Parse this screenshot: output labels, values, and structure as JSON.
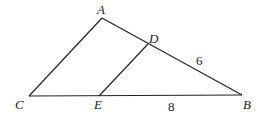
{
  "diagram": {
    "title": "",
    "type": "triangle-with-parallel-segment",
    "stroke_color": "#222222",
    "background": "#ffffff",
    "vertices": {
      "A": {
        "label": "A",
        "x": 102,
        "y": 18
      },
      "B": {
        "label": "B",
        "x": 242,
        "y": 95
      },
      "C": {
        "label": "C",
        "x": 29,
        "y": 96
      },
      "D": {
        "label": "D",
        "x": 148,
        "y": 44
      },
      "E": {
        "label": "E",
        "x": 99,
        "y": 96
      }
    },
    "segments": [
      {
        "from": "A",
        "to": "C"
      },
      {
        "from": "A",
        "to": "B"
      },
      {
        "from": "C",
        "to": "B"
      },
      {
        "from": "D",
        "to": "E"
      }
    ],
    "measures": {
      "DB": {
        "label": "6",
        "segment": "DB"
      },
      "EB": {
        "label": "8",
        "segment": "EB"
      }
    }
  }
}
